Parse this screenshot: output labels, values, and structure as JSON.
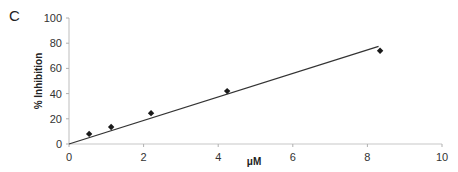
{
  "panel_label": "C",
  "chart_data": {
    "type": "scatter",
    "title": "",
    "xlabel": "μM",
    "ylabel": "% Inhibition",
    "xlim": [
      0,
      10
    ],
    "ylim": [
      0,
      100
    ],
    "x_ticks": [
      0,
      2,
      4,
      6,
      8,
      10
    ],
    "y_ticks": [
      0,
      20,
      40,
      60,
      80,
      100
    ],
    "grid": false,
    "legend": "none",
    "series": [
      {
        "name": "data",
        "marker": "diamond",
        "color": "#1a1a1a",
        "x": [
          0.54,
          1.13,
          2.2,
          4.24,
          8.34
        ],
        "y": [
          8,
          13.5,
          24.5,
          42,
          74
        ]
      }
    ],
    "trendline": {
      "type": "linear",
      "color": "#333333",
      "x": [
        0,
        8.3
      ],
      "y": [
        0,
        77.5
      ]
    }
  }
}
